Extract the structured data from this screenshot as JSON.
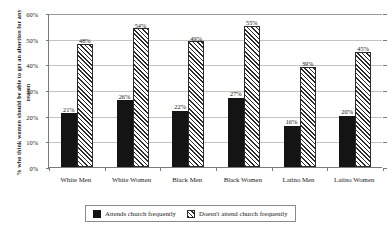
{
  "chart_data": {
    "type": "bar",
    "title": "",
    "xlabel": "",
    "ylabel": "% who think women should be able to get an abortion for any reason",
    "ylim": [
      0,
      60
    ],
    "ytick_labels": [
      "0%",
      "10%",
      "20%",
      "30%",
      "40%",
      "50%",
      "60%"
    ],
    "ytick_values": [
      0,
      10,
      20,
      30,
      40,
      50,
      60
    ],
    "grid": true,
    "legend_position": "bottom",
    "categories": [
      "White Men",
      "White Women",
      "Black Men",
      "Black Women",
      "Latino Men",
      "Latino Women"
    ],
    "series": [
      {
        "name": "Attends church frequently",
        "pattern": "solid",
        "color": "#141414",
        "values": [
          21,
          26,
          22,
          27,
          16,
          20
        ],
        "labels": [
          "21%",
          "26%",
          "22%",
          "27%",
          "16%",
          "20%"
        ]
      },
      {
        "name": "Doesn't attend church frequently",
        "pattern": "diagonal-hatch",
        "color": "#2b2b2b",
        "values": [
          48,
          54,
          49,
          55,
          39,
          45
        ],
        "labels": [
          "48%",
          "54%",
          "49%",
          "55%",
          "39%",
          "45%"
        ]
      }
    ]
  },
  "legend": {
    "entries": [
      {
        "label": "Attends church frequently"
      },
      {
        "label": "Doesn't attend church frequently"
      }
    ]
  },
  "colors": {
    "series_solid": "#141414",
    "series_hatch": "#2b2b2b",
    "gridline": "#c4c4c4",
    "axis": "#7a7a7a",
    "background": "#ffffff"
  }
}
